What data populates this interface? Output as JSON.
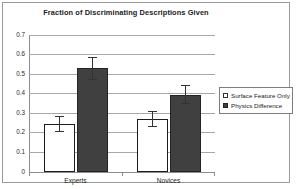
{
  "chart_data": {
    "type": "bar",
    "title": "Fraction of Discriminating Descriptions Given",
    "xlabel": "",
    "ylabel": "",
    "categories": [
      "Experts",
      "Novices"
    ],
    "series": [
      {
        "name": "Surface Feature Only",
        "swatch": "hollow-square",
        "color": "#ffffff",
        "values": [
          0.245,
          0.27
        ],
        "errors": [
          0.042,
          0.04
        ]
      },
      {
        "name": "Physics Difference",
        "swatch": "filled-square",
        "color": "#404040",
        "values": [
          0.53,
          0.395
        ],
        "errors": [
          0.06,
          0.05
        ]
      }
    ],
    "ylim": [
      0,
      0.7
    ],
    "ytick_values": [
      0,
      0.1,
      0.2,
      0.3,
      0.4,
      0.5,
      0.6,
      0.7
    ],
    "ytick_labels": [
      "0",
      "0.1",
      "0.2",
      "0.3",
      "0.4",
      "0.5",
      "0.6",
      "0.7"
    ],
    "grid": true,
    "grid_axis": "y",
    "legend_position": "right",
    "error_bars": true,
    "frame_border": true
  }
}
